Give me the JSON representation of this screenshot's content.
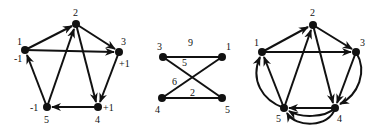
{
  "graphs": [
    {
      "id": "left",
      "type": "directed",
      "nodes": [
        {
          "id": "1",
          "label": "1",
          "supply": "-1"
        },
        {
          "id": "2",
          "label": "2",
          "supply": ""
        },
        {
          "id": "3",
          "label": "3",
          "supply": "+1"
        },
        {
          "id": "4",
          "label": "4",
          "supply": "+1"
        },
        {
          "id": "5",
          "label": "5",
          "supply": "-1"
        }
      ],
      "edges": [
        {
          "from": "1",
          "to": "2"
        },
        {
          "from": "1",
          "to": "3"
        },
        {
          "from": "2",
          "to": "3"
        },
        {
          "from": "2",
          "to": "4"
        },
        {
          "from": "5",
          "to": "2"
        },
        {
          "from": "3",
          "to": "4"
        },
        {
          "from": "4",
          "to": "5"
        },
        {
          "from": "5",
          "to": "1"
        }
      ]
    },
    {
      "id": "middle",
      "type": "undirected-weighted",
      "nodes": [
        {
          "id": "3",
          "label": "3"
        },
        {
          "id": "1",
          "label": "1"
        },
        {
          "id": "4",
          "label": "4"
        },
        {
          "id": "5",
          "label": "5"
        }
      ],
      "edges": [
        {
          "from": "3",
          "to": "1",
          "weight": "9"
        },
        {
          "from": "3",
          "to": "5",
          "weight": "5"
        },
        {
          "from": "4",
          "to": "1",
          "weight": "6"
        },
        {
          "from": "4",
          "to": "5",
          "weight": "2"
        }
      ]
    },
    {
      "id": "right",
      "type": "directed-multigraph",
      "nodes": [
        {
          "id": "1",
          "label": "1"
        },
        {
          "id": "2",
          "label": "2"
        },
        {
          "id": "3",
          "label": "3"
        },
        {
          "id": "4",
          "label": "4"
        },
        {
          "id": "5",
          "label": "5"
        }
      ],
      "edges": [
        {
          "from": "1",
          "to": "2"
        },
        {
          "from": "1",
          "to": "3"
        },
        {
          "from": "2",
          "to": "3"
        },
        {
          "from": "2",
          "to": "4"
        },
        {
          "from": "5",
          "to": "2"
        },
        {
          "from": "3",
          "to": "4"
        },
        {
          "from": "3",
          "to": "4",
          "curved": true
        },
        {
          "from": "4",
          "to": "5"
        },
        {
          "from": "4",
          "to": "5",
          "curved": true
        },
        {
          "from": "4",
          "to": "5",
          "curved": true
        },
        {
          "from": "5",
          "to": "1"
        },
        {
          "from": "5",
          "to": "1",
          "curved": true
        }
      ]
    }
  ],
  "labels": {
    "left": {
      "n1": "1",
      "n2": "2",
      "n3": "3",
      "n4": "4",
      "n5": "5",
      "s1": "-1",
      "s3": "+1",
      "s4": "+1",
      "s5": "-1"
    },
    "middle": {
      "n1": "1",
      "n3": "3",
      "n4": "4",
      "n5": "5",
      "w31": "9",
      "w35": "5",
      "w41": "6",
      "w45": "2"
    },
    "right": {
      "n1": "1",
      "n2": "2",
      "n3": "3",
      "n4": "4",
      "n5": "5"
    }
  }
}
